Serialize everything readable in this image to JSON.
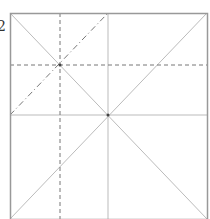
{
  "diagram": {
    "label": "2",
    "square": {
      "x1": 10,
      "y1": 13,
      "x2": 207,
      "y2": 219
    },
    "solid_lines": [
      {
        "x1": 10,
        "y1": 13,
        "x2": 207,
        "y2": 219
      },
      {
        "x1": 207,
        "y1": 13,
        "x2": 10,
        "y2": 219
      },
      {
        "x1": 108,
        "y1": 13,
        "x2": 108,
        "y2": 219
      },
      {
        "x1": 10,
        "y1": 115,
        "x2": 207,
        "y2": 115
      }
    ],
    "dashed_lines": [
      {
        "x1": 60,
        "y1": 13,
        "x2": 60,
        "y2": 219
      },
      {
        "x1": 10,
        "y1": 65,
        "x2": 207,
        "y2": 65
      }
    ],
    "dashdot_lines": [
      {
        "x1": 10,
        "y1": 115,
        "x2": 108,
        "y2": 13
      }
    ],
    "points": [
      {
        "x": 60,
        "y": 65
      },
      {
        "x": 108,
        "y": 115
      }
    ],
    "colors": {
      "frame": "#999999",
      "fold": "#bbbbbb",
      "dash": "#777777"
    }
  }
}
